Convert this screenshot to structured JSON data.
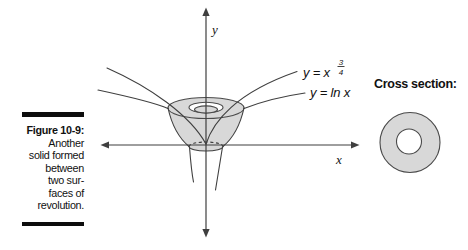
{
  "caption": {
    "label": "Figure 10-9:",
    "lines": [
      "Another",
      "solid formed",
      "between",
      "two sur-",
      "faces of",
      "revolution."
    ]
  },
  "diagram": {
    "y_axis_label": "y",
    "x_axis_label": "x",
    "curve1_label_base": "y = x",
    "curve1_exponent_numerator": "3",
    "curve1_exponent_denominator": "4",
    "curve2_label": "y = ln x",
    "cross_section_label": "Cross section:",
    "colors": {
      "solid_fill": "#d8d8d8",
      "outline": "#3f3f3f",
      "text": "#111111"
    }
  }
}
